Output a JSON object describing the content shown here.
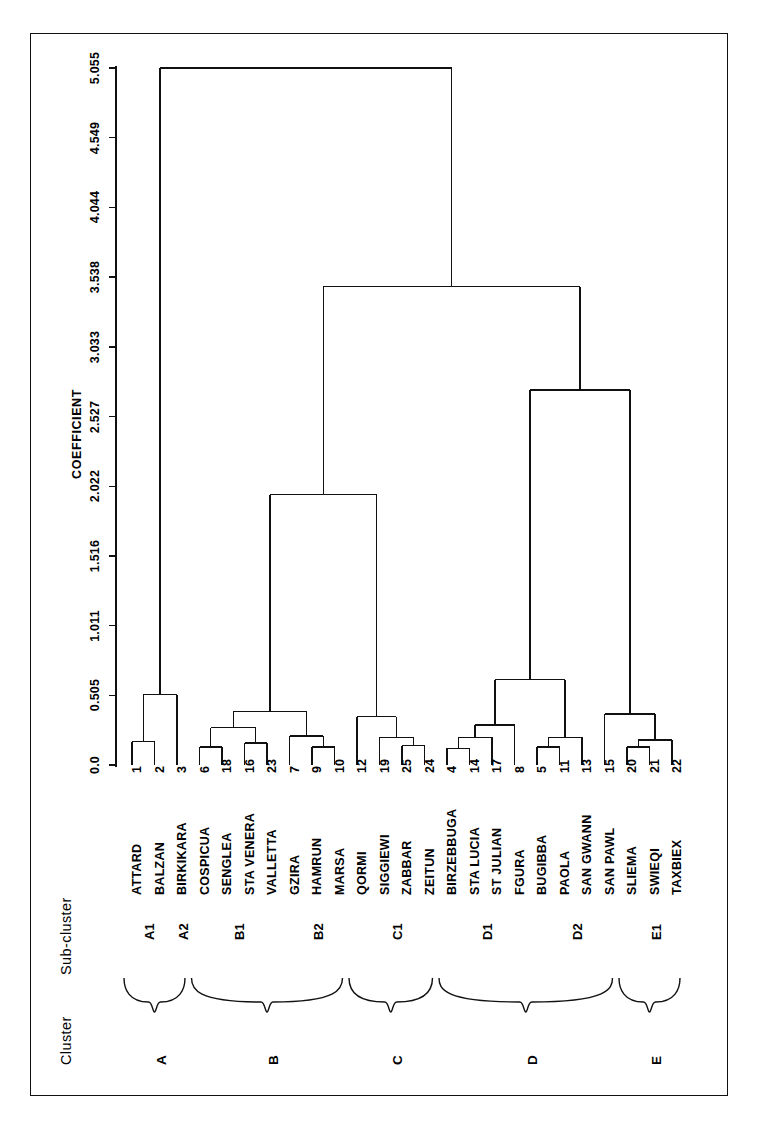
{
  "figure": {
    "type": "dendrogram",
    "orientation": "horizontal-leaves-bottom",
    "axis_title": "COEFFICIENT",
    "header_cluster": "Cluster",
    "header_subcluster": "Sub-cluster"
  },
  "axis": {
    "ticks": [
      "0.0",
      "0.505",
      "1.011",
      "1.516",
      "2.022",
      "2.527",
      "3.033",
      "3.538",
      "4.044",
      "4.549",
      "5.055"
    ],
    "values": [
      0.0,
      0.505,
      1.011,
      1.516,
      2.022,
      2.527,
      3.033,
      3.538,
      4.044,
      4.549,
      5.055
    ],
    "min": 0.0,
    "max": 5.055
  },
  "leaves": [
    {
      "num": "1",
      "name": "ATTARD",
      "subcluster": "A1",
      "cluster": "A"
    },
    {
      "num": "2",
      "name": "BALZAN",
      "subcluster": "A1",
      "cluster": "A"
    },
    {
      "num": "3",
      "name": "BIRKIKARA",
      "subcluster": "A2",
      "cluster": "A"
    },
    {
      "num": "6",
      "name": "COSPICUA",
      "subcluster": "B1",
      "cluster": "B"
    },
    {
      "num": "18",
      "name": "SENGLEA",
      "subcluster": "B1",
      "cluster": "B"
    },
    {
      "num": "16",
      "name": "STA VENERA",
      "subcluster": "B1",
      "cluster": "B"
    },
    {
      "num": "23",
      "name": "VALLETTA",
      "subcluster": "B1",
      "cluster": "B"
    },
    {
      "num": "7",
      "name": "GZIRA",
      "subcluster": "B2",
      "cluster": "B"
    },
    {
      "num": "9",
      "name": "HAMRUN",
      "subcluster": "B2",
      "cluster": "B"
    },
    {
      "num": "10",
      "name": "MARSA",
      "subcluster": "B2",
      "cluster": "B"
    },
    {
      "num": "12",
      "name": "QORMI",
      "subcluster": "C1",
      "cluster": "C"
    },
    {
      "num": "19",
      "name": "SIGGIEWI",
      "subcluster": "C1",
      "cluster": "C"
    },
    {
      "num": "25",
      "name": "ZABBAR",
      "subcluster": "C1",
      "cluster": "C"
    },
    {
      "num": "24",
      "name": "ZEITUN",
      "subcluster": "C1",
      "cluster": "C"
    },
    {
      "num": "4",
      "name": "BIRZEBBUGA",
      "subcluster": "D1",
      "cluster": "D"
    },
    {
      "num": "14",
      "name": "STA LUCIA",
      "subcluster": "D1",
      "cluster": "D"
    },
    {
      "num": "17",
      "name": "ST JULIAN",
      "subcluster": "D1",
      "cluster": "D"
    },
    {
      "num": "8",
      "name": "FGURA",
      "subcluster": "D1",
      "cluster": "D"
    },
    {
      "num": "5",
      "name": "BUGIBBA",
      "subcluster": "D2",
      "cluster": "D"
    },
    {
      "num": "11",
      "name": "PAOLA",
      "subcluster": "D2",
      "cluster": "D"
    },
    {
      "num": "13",
      "name": "SAN GWANN",
      "subcluster": "D2",
      "cluster": "D"
    },
    {
      "num": "15",
      "name": "SAN PAWL",
      "subcluster": "D2",
      "cluster": "D"
    },
    {
      "num": "20",
      "name": "SLIEMA",
      "subcluster": "E1",
      "cluster": "E"
    },
    {
      "num": "21",
      "name": "SWIEQI",
      "subcluster": "E1",
      "cluster": "E"
    },
    {
      "num": "22",
      "name": "TAXBIEX",
      "subcluster": "E1",
      "cluster": "E"
    }
  ],
  "subclusters": [
    {
      "label": "A1",
      "first": 0,
      "last": 1
    },
    {
      "label": "A2",
      "first": 2,
      "last": 2
    },
    {
      "label": "B1",
      "first": 3,
      "last": 6
    },
    {
      "label": "B2",
      "first": 7,
      "last": 9
    },
    {
      "label": "C1",
      "first": 10,
      "last": 13
    },
    {
      "label": "D1",
      "first": 14,
      "last": 17
    },
    {
      "label": "D2",
      "first": 18,
      "last": 21
    },
    {
      "label": "E1",
      "first": 22,
      "last": 24
    }
  ],
  "clusters": [
    {
      "label": "A",
      "first": 0,
      "last": 2
    },
    {
      "label": "B",
      "first": 3,
      "last": 9
    },
    {
      "label": "C",
      "first": 10,
      "last": 13
    },
    {
      "label": "D",
      "first": 14,
      "last": 21
    },
    {
      "label": "E",
      "first": 22,
      "last": 24
    }
  ],
  "chart_data": {
    "type": "dendrogram",
    "title": "",
    "xlabel": "COEFFICIENT",
    "ylabel": "",
    "xlim": [
      0.0,
      5.055
    ],
    "grid": false,
    "legend": "none",
    "leaf_order": [
      "ATTARD",
      "BALZAN",
      "BIRKIKARA",
      "COSPICUA",
      "SENGLEA",
      "STA VENERA",
      "VALLETTA",
      "GZIRA",
      "HAMRUN",
      "MARSA",
      "QORMI",
      "SIGGIEWI",
      "ZABBAR",
      "ZEITUN",
      "BIRZEBBUGA",
      "STA LUCIA",
      "ST JULIAN",
      "FGURA",
      "BUGIBBA",
      "PAOLA",
      "SAN GWANN",
      "SAN PAWL",
      "SLIEMA",
      "SWIEQI",
      "TAXBIEX"
    ],
    "leaf_ids": [
      1,
      2,
      3,
      6,
      18,
      16,
      23,
      7,
      9,
      10,
      12,
      19,
      25,
      24,
      4,
      14,
      17,
      8,
      5,
      11,
      13,
      15,
      20,
      21,
      22
    ],
    "merges": [
      {
        "id": "m1",
        "children": [
          "L0",
          "L1"
        ],
        "height": 0.17
      },
      {
        "id": "m2",
        "children": [
          "m1",
          "L2"
        ],
        "height": 0.51
      },
      {
        "id": "m3",
        "children": [
          "L3",
          "L4"
        ],
        "height": 0.13
      },
      {
        "id": "m4",
        "children": [
          "L5",
          "L6"
        ],
        "height": 0.16
      },
      {
        "id": "m5",
        "children": [
          "m3",
          "m4"
        ],
        "height": 0.27
      },
      {
        "id": "m6",
        "children": [
          "L8",
          "L9"
        ],
        "height": 0.13
      },
      {
        "id": "m7",
        "children": [
          "L7",
          "m6"
        ],
        "height": 0.21
      },
      {
        "id": "m8",
        "children": [
          "m5",
          "m7"
        ],
        "height": 0.39
      },
      {
        "id": "m9",
        "children": [
          "L12",
          "L13"
        ],
        "height": 0.14
      },
      {
        "id": "m10",
        "children": [
          "L11",
          "m9"
        ],
        "height": 0.2
      },
      {
        "id": "m11",
        "children": [
          "L10",
          "m10"
        ],
        "height": 0.35
      },
      {
        "id": "m12",
        "children": [
          "m8",
          "m11"
        ],
        "height": 1.96
      },
      {
        "id": "m13",
        "children": [
          "L14",
          "L15"
        ],
        "height": 0.12
      },
      {
        "id": "m14",
        "children": [
          "m13",
          "L16"
        ],
        "height": 0.2
      },
      {
        "id": "m15",
        "children": [
          "m14",
          "L17"
        ],
        "height": 0.29
      },
      {
        "id": "m16",
        "children": [
          "L18",
          "L19"
        ],
        "height": 0.13
      },
      {
        "id": "m17",
        "children": [
          "m16",
          "L20"
        ],
        "height": 0.2
      },
      {
        "id": "m18",
        "children": [
          "m15",
          "m17"
        ],
        "height": 0.62
      },
      {
        "id": "m19",
        "children": [
          "L22",
          "L23"
        ],
        "height": 0.13
      },
      {
        "id": "m20",
        "children": [
          "m19",
          "L24"
        ],
        "height": 0.18
      },
      {
        "id": "m21",
        "children": [
          "L21",
          "m20"
        ],
        "height": 0.37
      },
      {
        "id": "m22",
        "children": [
          "m18",
          "m21"
        ],
        "height": 2.72
      },
      {
        "id": "m23",
        "children": [
          "m12",
          "m22"
        ],
        "height": 3.47
      },
      {
        "id": "m24",
        "children": [
          "m2",
          "m23"
        ],
        "height": 5.055
      }
    ]
  }
}
